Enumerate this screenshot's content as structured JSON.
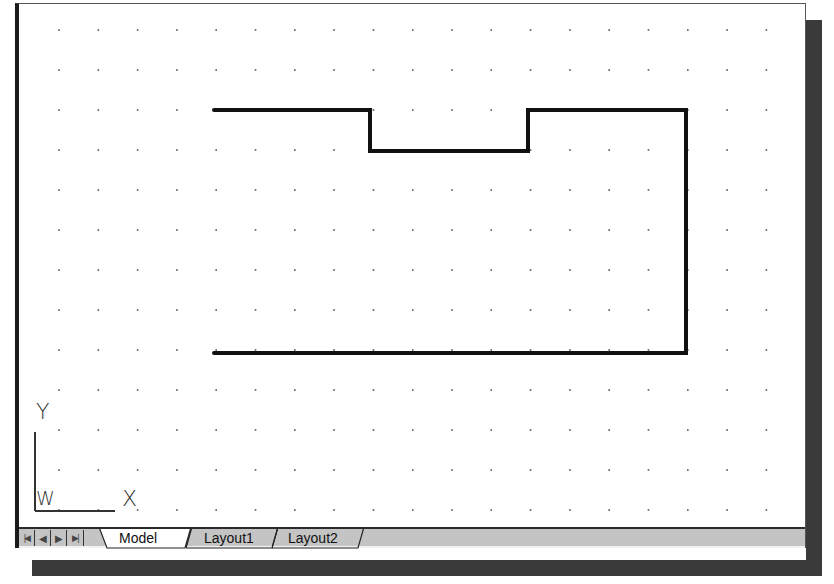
{
  "drawing": {
    "grid": {
      "origin_x": 40,
      "origin_y": 26,
      "spacing_x": 39.3,
      "spacing_y": 40,
      "cols": 20,
      "rows": 13,
      "dot_color": "#555555"
    },
    "polyline": {
      "points": "195,106 351,106 351,147 509,147 509,106 667,106 667,349 195,349",
      "stroke": "#111111",
      "stroke_width": 4
    }
  },
  "ucs_icon": {
    "y_label": "Y",
    "x_label": "X",
    "w_label": "W"
  },
  "tabs": {
    "nav_buttons": [
      {
        "name": "first-tab-button",
        "glyph": "|◀"
      },
      {
        "name": "previous-tab-button",
        "glyph": "◀"
      },
      {
        "name": "next-tab-button",
        "glyph": "▶"
      },
      {
        "name": "last-tab-button",
        "glyph": "▶|"
      }
    ],
    "items": [
      {
        "label": "Model",
        "active": true
      },
      {
        "label": "Layout1",
        "active": false
      },
      {
        "label": "Layout2",
        "active": false
      }
    ]
  },
  "colors": {
    "background": "#ffffff",
    "tabbar": "#c4c4c4",
    "shadow": "#3a3a3a",
    "line": "#111111"
  }
}
